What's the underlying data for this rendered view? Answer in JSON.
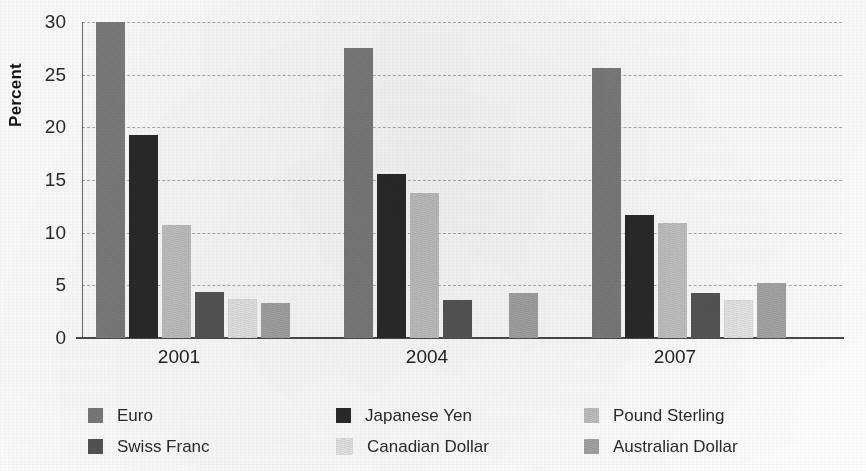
{
  "chart_data": {
    "type": "bar",
    "title": "",
    "subtitle": "",
    "xlabel": "",
    "ylabel": "Percent",
    "categories": [
      "2001",
      "2004",
      "2007"
    ],
    "ylim": [
      0,
      30
    ],
    "yticks": [
      0,
      5,
      10,
      15,
      20,
      25,
      30
    ],
    "ytick_labels": [
      "0",
      "5",
      "10",
      "15",
      "20",
      "25",
      "30"
    ],
    "grid": "horizontal-dashed",
    "legend_position": "bottom",
    "legend_columns": 3,
    "series": [
      {
        "name": "Euro",
        "color": "#7d7d7d",
        "values": [
          30.0,
          27.5,
          25.6
        ]
      },
      {
        "name": "Japanese Yen",
        "color": "#2b2b2b",
        "values": [
          19.3,
          15.6,
          11.7
        ]
      },
      {
        "name": "Pound Sterling",
        "color": "#c3c3c3",
        "values": [
          10.7,
          13.8,
          10.9
        ]
      },
      {
        "name": "Swiss Franc",
        "color": "#565656",
        "values": [
          4.4,
          3.6,
          4.3
        ]
      },
      {
        "name": "Canadian Dollar",
        "color": "#e8e8e8",
        "values": [
          3.7,
          0.0,
          3.6
        ]
      },
      {
        "name": "Australian Dollar",
        "color": "#a6a6a6",
        "values": [
          3.3,
          4.3,
          5.2
        ]
      }
    ]
  },
  "axis": {
    "y_title": "Percent"
  },
  "colors": {
    "gridline": "#6b6b6b",
    "axis": "#4a4a4a",
    "text": "#232323",
    "background": "#fdfdfb"
  }
}
